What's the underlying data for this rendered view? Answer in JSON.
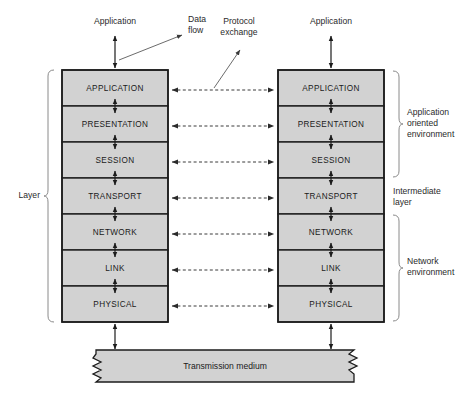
{
  "diagram": {
    "colors": {
      "box_fill": "#d2d2d2",
      "outline": "#1c1c1c",
      "bracket": "#8a8a8a",
      "dashed_arrow": "#3a3a3a",
      "background": "#ffffff"
    }
  },
  "layers": [
    {
      "name": "APPLICATION"
    },
    {
      "name": "PRESENTATION"
    },
    {
      "name": "SESSION"
    },
    {
      "name": "TRANSPORT"
    },
    {
      "name": "NETWORK"
    },
    {
      "name": "LINK"
    },
    {
      "name": "PHYSICAL"
    }
  ],
  "stacks": [
    {
      "id": "left",
      "top_label": "Application"
    },
    {
      "id": "right",
      "top_label": "Application"
    }
  ],
  "annotations": {
    "data_flow": {
      "line1": "Data",
      "line2": "flow"
    },
    "protocol_exchange": {
      "line1": "Protocol",
      "line2": "exchange"
    },
    "layer_bracket": "Layer"
  },
  "environments": [
    {
      "line1": "Application",
      "line2": "oriented",
      "line3": "environment"
    },
    {
      "line1": "Intermediate",
      "line2": "layer",
      "line3": ""
    },
    {
      "line1": "Network",
      "line2": "environment",
      "line3": ""
    }
  ],
  "medium": {
    "label": "Transmission medium"
  }
}
